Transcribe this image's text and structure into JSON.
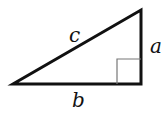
{
  "diagram": {
    "type": "right-triangle",
    "labels": {
      "hypotenuse": "c",
      "vertical_leg": "a",
      "horizontal_leg": "b"
    },
    "right_angle_marker": true,
    "colors": {
      "stroke": "#111111",
      "marker": "#777777",
      "background": "#ffffff"
    }
  }
}
